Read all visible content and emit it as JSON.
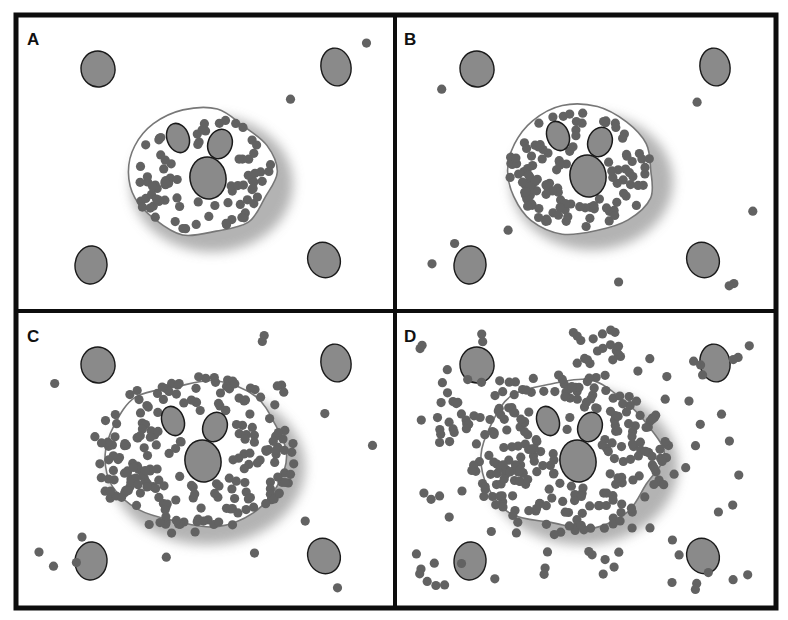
{
  "figure": {
    "width": 788,
    "height": 620,
    "frame": {
      "x": 16,
      "y": 15,
      "w": 760,
      "h": 593,
      "stroke": "#0d0d0d",
      "stroke_width": 5
    },
    "divider": {
      "x": 395,
      "y": 311,
      "stroke_width": 4
    },
    "colors": {
      "granule": "#626262",
      "nucleus_fill": "#8a8a8a",
      "nucleus_stroke": "#1a1a1a",
      "cell_fill": "#ffffff",
      "cell_stroke": "#777777",
      "shadow": "#9a9a9a",
      "background": "#ffffff"
    },
    "panels": [
      {
        "id": "A",
        "label": "A",
        "description": "Mast cell at rest with granules contained in cytoplasm; a few granules near the lower-left membrane",
        "origin": [
          18,
          17
        ],
        "cell": {
          "cx": 200,
          "cy": 172,
          "rx": 75,
          "ry": 62,
          "granules_inside": 70,
          "granules_outside": 2
        },
        "surrounding_cells": 4
      },
      {
        "id": "B",
        "label": "B",
        "description": "Early degranulation: more granules inside, a few released into surrounding tissue",
        "origin": [
          397,
          17
        ],
        "cell": {
          "cx": 580,
          "cy": 170,
          "rx": 75,
          "ry": 62,
          "granules_inside": 110,
          "granules_outside": 9
        },
        "surrounding_cells": 4
      },
      {
        "id": "C",
        "label": "C",
        "description": "Granules accumulate at cell surface and begin dispersing",
        "origin": [
          18,
          313
        ],
        "cell": {
          "cx": 195,
          "cy": 455,
          "rx": 92,
          "ry": 72,
          "granules_inside": 200,
          "granules_outside": 16
        },
        "surrounding_cells": 4
      },
      {
        "id": "D",
        "label": "D",
        "description": "Extensive degranulation with widespread granule dispersal into tissue",
        "origin": [
          397,
          313
        ],
        "cell": {
          "cx": 570,
          "cy": 455,
          "rx": 90,
          "ry": 72,
          "granules_inside": 220,
          "granules_outside": 110
        },
        "surrounding_cells": 4
      }
    ]
  }
}
